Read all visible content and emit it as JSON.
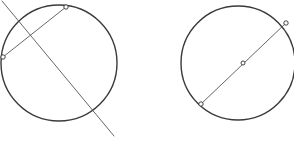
{
  "figure": {
    "background_color": "#ffffff",
    "stroke_color": "#3a3a3a",
    "secant_color": "#55555a",
    "marker_fill": "#ffffff",
    "marker_stroke": "#2f2f2f",
    "width": 294,
    "height": 143
  },
  "panels": [
    {
      "id": "left-panel",
      "name": "circle-with-secant",
      "caption": "",
      "circle": {
        "name": "left-circle",
        "cx": 59,
        "cy": 63,
        "r": 58,
        "stroke_width": 1.4
      },
      "chord": {
        "name": "left-chord",
        "x1": 3,
        "y1": 57,
        "x2": 66,
        "y2": 7,
        "stroke_width": 0.9
      },
      "secant": {
        "name": "left-secant-line",
        "x1": 2,
        "y1": 1,
        "x2": 114,
        "y2": 136,
        "stroke_width": 0.9
      },
      "points": [
        {
          "name": "chord-endpoint-left",
          "x": 3,
          "y": 57,
          "r": 2.2
        },
        {
          "name": "chord-endpoint-top",
          "x": 66,
          "y": 7,
          "r": 2.2
        }
      ]
    },
    {
      "id": "right-panel",
      "name": "circle-with-diameter-chord",
      "caption": "",
      "circle": {
        "name": "right-circle",
        "cx": 238,
        "cy": 63,
        "r": 57,
        "stroke_width": 1.4
      },
      "chord": {
        "name": "right-chord",
        "x1": 201,
        "y1": 104,
        "x2": 286,
        "y2": 23,
        "stroke_width": 0.9
      },
      "points": [
        {
          "name": "chord-endpoint-lower-left",
          "x": 201,
          "y": 104,
          "r": 2.2
        },
        {
          "name": "chord-midpoint",
          "x": 243,
          "y": 63,
          "r": 2.0
        },
        {
          "name": "chord-endpoint-upper-right",
          "x": 286,
          "y": 23,
          "r": 2.2
        }
      ]
    }
  ],
  "captions": {
    "left": "",
    "right": ""
  }
}
